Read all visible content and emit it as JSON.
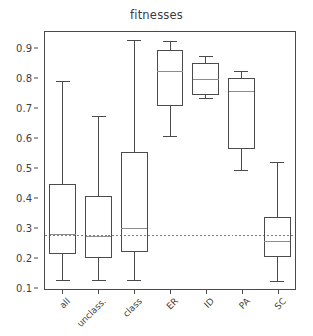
{
  "chart_data": {
    "type": "box",
    "title": "fitnesses",
    "xlabel": "",
    "ylabel": "",
    "ylim": [
      0.095,
      0.955
    ],
    "yticks": [
      0.1,
      0.2,
      0.3,
      0.4,
      0.5,
      0.6,
      0.7,
      0.8,
      0.9
    ],
    "ytick_labels": [
      "0.1",
      "0.2",
      "0.3",
      "0.4",
      "0.5",
      "0.6",
      "0.7",
      "0.8",
      "0.9"
    ],
    "grid": false,
    "legend": null,
    "reference_line": {
      "name": "baseline-dashed-line",
      "value": 0.275,
      "style": "dashed",
      "color": "#7a7a7a"
    },
    "categories": [
      "all",
      "unclass.",
      "class",
      "ER",
      "ID",
      "PA",
      "SC"
    ],
    "boxes": [
      {
        "label": "all",
        "whisker_low": 0.123,
        "q1": 0.213,
        "median": 0.277,
        "q3": 0.445,
        "whisker_high": 0.79
      },
      {
        "label": "unclass.",
        "whisker_low": 0.123,
        "q1": 0.2,
        "median": 0.272,
        "q3": 0.405,
        "whisker_high": 0.672
      },
      {
        "label": "class",
        "whisker_low": 0.123,
        "q1": 0.22,
        "median": 0.297,
        "q3": 0.552,
        "whisker_high": 0.928
      },
      {
        "label": "ER",
        "whisker_low": 0.605,
        "q1": 0.71,
        "median": 0.823,
        "q3": 0.892,
        "whisker_high": 0.923
      },
      {
        "label": "ID",
        "whisker_low": 0.733,
        "q1": 0.747,
        "median": 0.797,
        "q3": 0.851,
        "whisker_high": 0.872
      },
      {
        "label": "PA",
        "whisker_low": 0.493,
        "q1": 0.565,
        "median": 0.757,
        "q3": 0.8,
        "whisker_high": 0.822
      },
      {
        "label": "SC",
        "whisker_low": 0.12,
        "q1": 0.203,
        "median": 0.255,
        "q3": 0.333,
        "whisker_high": 0.517
      }
    ],
    "colors": {
      "box_edge": "#4a4a4a",
      "median": "#8c8c8c",
      "whisker": "#4a4a4a",
      "cap": "#4a4a4a",
      "reference": "#7a7a7a",
      "frame": "#4a4a4a",
      "text": "#3f3f3f",
      "background": "#ffffff"
    }
  }
}
